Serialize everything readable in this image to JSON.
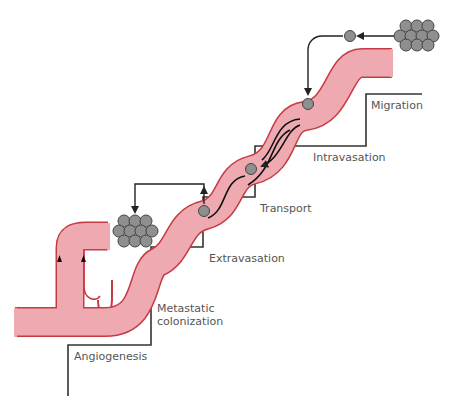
{
  "diagram": {
    "title": "",
    "colors": {
      "vessel_fill": "#eeaab0",
      "vessel_edge": "#c63a44",
      "cell_fill": "#8f8f8f",
      "cell_edge": "#444444",
      "line": "#222222",
      "stair": "#333333",
      "text": "#555555"
    },
    "steps": [
      {
        "label": "Migration"
      },
      {
        "label": "Intravasation"
      },
      {
        "label": "Transport"
      },
      {
        "label": "Extravasation"
      },
      {
        "label": "Metastatic\ncolonization",
        "line1": "Metastatic",
        "line2": "colonization"
      },
      {
        "label": "Angiogenesis"
      }
    ],
    "elements": {
      "primary_tumor": "tumor-cell-cluster",
      "metastatic_tumor": "tumor-cell-cluster",
      "blood_vessel": "blood-vessel",
      "migrating_cell": "tumor-cell",
      "arrows": "arrow-icon"
    }
  }
}
